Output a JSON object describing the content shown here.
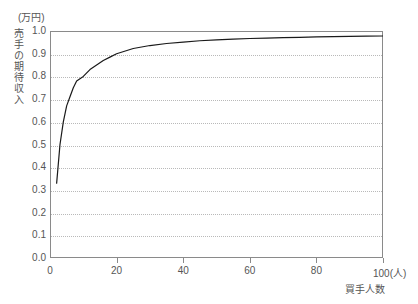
{
  "chart_data": {
    "type": "line",
    "title": "",
    "subtitle": "",
    "xlabel": "買手人数",
    "ylabel": "売手の期待収入",
    "yunit": "(万円)",
    "xunit": "(人)",
    "xlim": [
      0,
      100
    ],
    "ylim": [
      0.0,
      1.0
    ],
    "grid": "horizontal-dotted",
    "legend": "none",
    "xticks": [
      0,
      20,
      40,
      60,
      80,
      100
    ],
    "xtick_labels": [
      "0",
      "20",
      "40",
      "60",
      "80",
      "100(人)"
    ],
    "yticks": [
      0.0,
      0.1,
      0.2,
      0.3,
      0.4,
      0.5,
      0.6,
      0.7,
      0.8,
      0.9,
      1.0
    ],
    "ytick_labels": [
      "0.0",
      "0.1",
      "0.2",
      "0.3",
      "0.4",
      "0.5",
      "0.6",
      "0.7",
      "0.8",
      "0.9",
      "1.0"
    ],
    "series": [
      {
        "name": "売手の期待収入",
        "color": "#1a1a1a",
        "x": [
          2,
          3,
          4,
          5,
          6,
          7,
          8,
          9,
          10,
          12,
          14,
          16,
          18,
          20,
          25,
          30,
          35,
          40,
          45,
          50,
          55,
          60,
          65,
          70,
          75,
          80,
          85,
          90,
          95,
          100
        ],
        "values": [
          0.33,
          0.5,
          0.6,
          0.67,
          0.71,
          0.75,
          0.78,
          0.79,
          0.8,
          0.83,
          0.85,
          0.87,
          0.885,
          0.9,
          0.923,
          0.936,
          0.945,
          0.951,
          0.957,
          0.961,
          0.964,
          0.967,
          0.969,
          0.971,
          0.972,
          0.974,
          0.975,
          0.976,
          0.977,
          0.978
        ]
      }
    ],
    "axis_color": "#8a8a8a",
    "grid_color": "#b9b9b9",
    "background": "#ffffff"
  }
}
